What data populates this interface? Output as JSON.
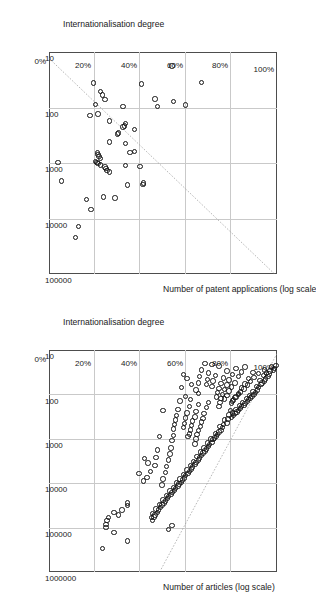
{
  "figure": {
    "background": "#ffffff",
    "marker_color": "#151515",
    "grid_color": "#c9c9c9",
    "frame_color": "#4d4d4d",
    "trend_color": "#9a9a9a",
    "orientation_note": "charts rotated 90 degrees"
  },
  "chart_data": [
    {
      "id": "patents",
      "type": "scatter",
      "title": "",
      "xlabel": "Number of patent applications (log scale)",
      "ylabel": "Internationalisation degree",
      "xscale": "log",
      "xlim": [
        10,
        100000
      ],
      "ylim": [
        0,
        1
      ],
      "xticks": [
        "10",
        "100",
        "1000",
        "10000",
        "100000"
      ],
      "yticks": [
        "0%",
        "20%",
        "40%",
        "60%",
        "80%",
        "100%"
      ],
      "grid": true,
      "legend": "none",
      "trendline": {
        "type": "log-linear",
        "x0": 13,
        "y0": 0.0,
        "x1": 110000,
        "y1": 1.0
      },
      "points": [
        [
          35,
          0.67
        ],
        [
          18,
          0.54
        ],
        [
          90,
          0.6
        ],
        [
          78,
          0.545
        ],
        [
          95,
          0.475
        ],
        [
          70,
          0.465
        ],
        [
          38,
          0.405
        ],
        [
          2300,
          0.415
        ],
        [
          2450,
          0.412
        ],
        [
          1150,
          0.4
        ],
        [
          620,
          0.375
        ],
        [
          640,
          0.355
        ],
        [
          250,
          0.375
        ],
        [
          195,
          0.335
        ],
        [
          215,
          0.33
        ],
        [
          225,
          0.325
        ],
        [
          95,
          0.325
        ],
        [
          440,
          0.335
        ],
        [
          290,
          0.305
        ],
        [
          300,
          0.3
        ],
        [
          1100,
          0.335
        ],
        [
          2500,
          0.345
        ],
        [
          4300,
          0.29
        ],
        [
          1450,
          0.265
        ],
        [
          1350,
          0.255
        ],
        [
          1250,
          0.25
        ],
        [
          1180,
          0.245
        ],
        [
          1080,
          0.225
        ],
        [
          1020,
          0.215
        ],
        [
          990,
          0.21
        ],
        [
          950,
          0.205
        ],
        [
          820,
          0.225
        ],
        [
          760,
          0.22
        ],
        [
          700,
          0.215
        ],
        [
          640,
          0.212
        ],
        [
          420,
          0.265
        ],
        [
          175,
          0.265
        ],
        [
          130,
          0.215
        ],
        [
          72,
          0.245
        ],
        [
          60,
          0.235
        ],
        [
          52,
          0.225
        ],
        [
          88,
          0.205
        ],
        [
          36,
          0.195
        ],
        [
          140,
          0.18
        ],
        [
          4100,
          0.24
        ],
        [
          4500,
          0.165
        ],
        [
          6800,
          0.185
        ],
        [
          14000,
          0.13
        ],
        [
          22000,
          0.115
        ],
        [
          2100,
          0.055
        ],
        [
          980,
          0.04
        ]
      ]
    },
    {
      "id": "articles",
      "type": "scatter",
      "title": "",
      "xlabel": "Number of articles (log scale)",
      "ylabel": "Internationalisation degree",
      "xscale": "log",
      "xlim": [
        10,
        1000000
      ],
      "ylim": [
        0,
        1
      ],
      "xticks": [
        "10",
        "100",
        "1000",
        "10000",
        "100000",
        "1000000"
      ],
      "yticks": [
        "0%",
        "20%",
        "40%",
        "60%",
        "80%",
        "100%"
      ],
      "grid": true,
      "legend": "none",
      "trendline": {
        "type": "log-linear",
        "x0": 12,
        "y0": 1.0,
        "x1": 900000,
        "y1": 0.49
      },
      "points": [
        [
          22,
          0.995
        ],
        [
          26,
          0.99
        ],
        [
          28,
          0.985
        ],
        [
          24,
          0.975
        ],
        [
          30,
          0.97
        ],
        [
          35,
          0.965
        ],
        [
          40,
          0.96
        ],
        [
          33,
          0.955
        ],
        [
          45,
          0.95
        ],
        [
          50,
          0.945
        ],
        [
          38,
          0.94
        ],
        [
          55,
          0.935
        ],
        [
          60,
          0.93
        ],
        [
          48,
          0.925
        ],
        [
          70,
          0.92
        ],
        [
          80,
          0.915
        ],
        [
          66,
          0.91
        ],
        [
          90,
          0.905
        ],
        [
          100,
          0.9
        ],
        [
          85,
          0.895
        ],
        [
          110,
          0.89
        ],
        [
          120,
          0.885
        ],
        [
          105,
          0.88
        ],
        [
          130,
          0.875
        ],
        [
          145,
          0.87
        ],
        [
          125,
          0.865
        ],
        [
          160,
          0.86
        ],
        [
          175,
          0.855
        ],
        [
          150,
          0.85
        ],
        [
          190,
          0.845
        ],
        [
          210,
          0.84
        ],
        [
          180,
          0.835
        ],
        [
          230,
          0.83
        ],
        [
          250,
          0.825
        ],
        [
          220,
          0.82
        ],
        [
          270,
          0.815
        ],
        [
          300,
          0.81
        ],
        [
          260,
          0.805
        ],
        [
          330,
          0.8
        ],
        [
          28,
          0.945
        ],
        [
          34,
          0.92
        ],
        [
          42,
          0.9
        ],
        [
          52,
          0.885
        ],
        [
          62,
          0.87
        ],
        [
          75,
          0.855
        ],
        [
          88,
          0.84
        ],
        [
          100,
          0.83
        ],
        [
          115,
          0.82
        ],
        [
          135,
          0.81
        ],
        [
          155,
          0.8
        ],
        [
          32,
          0.895
        ],
        [
          44,
          0.875
        ],
        [
          58,
          0.86
        ],
        [
          72,
          0.845
        ],
        [
          95,
          0.83
        ],
        [
          118,
          0.815
        ],
        [
          140,
          0.805
        ],
        [
          24,
          0.86
        ],
        [
          31,
          0.845
        ],
        [
          40,
          0.83
        ],
        [
          55,
          0.815
        ],
        [
          68,
          0.8
        ],
        [
          84,
          0.79
        ],
        [
          105,
          0.78
        ],
        [
          128,
          0.77
        ],
        [
          26,
          0.82
        ],
        [
          36,
          0.805
        ],
        [
          47,
          0.79
        ],
        [
          61,
          0.78
        ],
        [
          78,
          0.77
        ],
        [
          99,
          0.76
        ],
        [
          122,
          0.755
        ],
        [
          150,
          0.75
        ],
        [
          185,
          0.745
        ],
        [
          30,
          0.78
        ],
        [
          43,
          0.765
        ],
        [
          57,
          0.755
        ],
        [
          74,
          0.745
        ],
        [
          92,
          0.74
        ],
        [
          115,
          0.735
        ],
        [
          23,
          0.745
        ],
        [
          38,
          0.73
        ],
        [
          50,
          0.72
        ],
        [
          66,
          0.715
        ],
        [
          21,
          0.715
        ],
        [
          33,
          0.7
        ],
        [
          46,
          0.695
        ],
        [
          60,
          0.69
        ],
        [
          20,
          0.685
        ],
        [
          28,
          0.67
        ],
        [
          40,
          0.66
        ],
        [
          55,
          0.655
        ],
        [
          230,
          0.795
        ],
        [
          290,
          0.79
        ],
        [
          360,
          0.785
        ],
        [
          440,
          0.78
        ],
        [
          380,
          0.77
        ],
        [
          470,
          0.765
        ],
        [
          560,
          0.76
        ],
        [
          640,
          0.755
        ],
        [
          520,
          0.75
        ],
        [
          700,
          0.745
        ],
        [
          800,
          0.74
        ],
        [
          880,
          0.735
        ],
        [
          760,
          0.73
        ],
        [
          950,
          0.725
        ],
        [
          1050,
          0.72
        ],
        [
          1200,
          0.715
        ],
        [
          1000,
          0.71
        ],
        [
          1350,
          0.705
        ],
        [
          1500,
          0.7
        ],
        [
          1250,
          0.695
        ],
        [
          1700,
          0.69
        ],
        [
          1900,
          0.685
        ],
        [
          1600,
          0.68
        ],
        [
          2100,
          0.675
        ],
        [
          2400,
          0.67
        ],
        [
          2000,
          0.665
        ],
        [
          2700,
          0.66
        ],
        [
          3000,
          0.655
        ],
        [
          2500,
          0.65
        ],
        [
          3400,
          0.645
        ],
        [
          3800,
          0.64
        ],
        [
          3200,
          0.635
        ],
        [
          4300,
          0.63
        ],
        [
          4800,
          0.625
        ],
        [
          4000,
          0.62
        ],
        [
          5400,
          0.615
        ],
        [
          6000,
          0.61
        ],
        [
          5000,
          0.605
        ],
        [
          6800,
          0.6
        ],
        [
          7600,
          0.595
        ],
        [
          6400,
          0.59
        ],
        [
          8500,
          0.585
        ],
        [
          9500,
          0.58
        ],
        [
          8000,
          0.575
        ],
        [
          10500,
          0.57
        ],
        [
          11500,
          0.565
        ],
        [
          9800,
          0.56
        ],
        [
          13000,
          0.555
        ],
        [
          14500,
          0.55
        ],
        [
          12500,
          0.545
        ],
        [
          16000,
          0.54
        ],
        [
          18000,
          0.535
        ],
        [
          15000,
          0.53
        ],
        [
          20000,
          0.525
        ],
        [
          22000,
          0.52
        ],
        [
          19000,
          0.515
        ],
        [
          25000,
          0.51
        ],
        [
          28000,
          0.505
        ],
        [
          24000,
          0.5
        ],
        [
          31000,
          0.495
        ],
        [
          35000,
          0.49
        ],
        [
          30000,
          0.485
        ],
        [
          40000,
          0.48
        ],
        [
          45000,
          0.475
        ],
        [
          38000,
          0.47
        ],
        [
          52000,
          0.465
        ],
        [
          58000,
          0.46
        ],
        [
          48000,
          0.455
        ],
        [
          70000,
          0.455
        ],
        [
          90000,
          0.54
        ],
        [
          110000,
          0.525
        ],
        [
          60000,
          0.45
        ],
        [
          150,
          0.7
        ],
        [
          200,
          0.69
        ],
        [
          270,
          0.68
        ],
        [
          350,
          0.675
        ],
        [
          420,
          0.67
        ],
        [
          520,
          0.665
        ],
        [
          650,
          0.655
        ],
        [
          800,
          0.65
        ],
        [
          1000,
          0.645
        ],
        [
          1300,
          0.64
        ],
        [
          170,
          0.655
        ],
        [
          240,
          0.645
        ],
        [
          320,
          0.64
        ],
        [
          400,
          0.63
        ],
        [
          500,
          0.625
        ],
        [
          630,
          0.62
        ],
        [
          780,
          0.615
        ],
        [
          900,
          0.61
        ],
        [
          190,
          0.615
        ],
        [
          260,
          0.605
        ],
        [
          340,
          0.6
        ],
        [
          450,
          0.595
        ],
        [
          560,
          0.59
        ],
        [
          130,
          0.62
        ],
        [
          110,
          0.6
        ],
        [
          95,
          0.655
        ],
        [
          80,
          0.645
        ],
        [
          60,
          0.625
        ],
        [
          44,
          0.605
        ],
        [
          36,
          0.59
        ],
        [
          70,
          0.58
        ],
        [
          140,
          0.575
        ],
        [
          220,
          0.565
        ],
        [
          300,
          0.56
        ],
        [
          380,
          0.555
        ],
        [
          480,
          0.55
        ],
        [
          600,
          0.545
        ],
        [
          850,
          0.545
        ],
        [
          1100,
          0.54
        ],
        [
          1600,
          0.535
        ],
        [
          2200,
          0.53
        ],
        [
          3000,
          0.525
        ],
        [
          4200,
          0.515
        ],
        [
          5800,
          0.51
        ],
        [
          8000,
          0.5
        ],
        [
          11000,
          0.495
        ],
        [
          230,
          0.5
        ],
        [
          900,
          0.485
        ],
        [
          1800,
          0.475
        ],
        [
          2600,
          0.47
        ],
        [
          4000,
          0.465
        ],
        [
          5500,
          0.445
        ],
        [
          3500,
          0.435
        ],
        [
          7500,
          0.43
        ],
        [
          2800,
          0.42
        ],
        [
          9000,
          0.415
        ],
        [
          6000,
          0.395
        ],
        [
          200000,
          0.345
        ],
        [
          28000,
          0.345
        ],
        [
          32000,
          0.345
        ],
        [
          40000,
          0.32
        ],
        [
          52000,
          0.305
        ],
        [
          45000,
          0.285
        ],
        [
          60000,
          0.26
        ],
        [
          70000,
          0.255
        ],
        [
          85000,
          0.25
        ],
        [
          100000,
          0.25
        ],
        [
          130000,
          0.285
        ],
        [
          300000,
          0.235
        ]
      ]
    }
  ]
}
